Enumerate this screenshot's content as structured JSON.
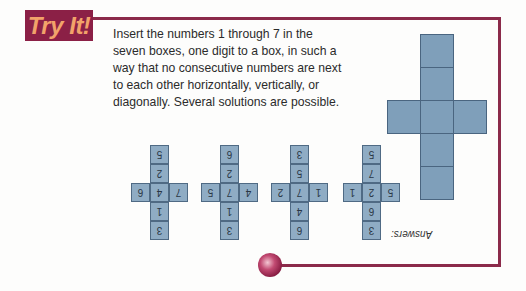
{
  "badge": {
    "label": "Try It!"
  },
  "instructions": {
    "text": "Insert the numbers 1 through 7 in the seven boxes, one digit to a box, in such a way that no consecutive numbers are next to each other horizontally, vertically, or diagonally. Several solutions are possible."
  },
  "answers": {
    "label": "Answers:",
    "orientation": "upside-down",
    "grids": [
      {
        "top": "3",
        "upper": "6",
        "left": "5",
        "center": "2",
        "right": "1",
        "lower": "7",
        "bottom": "5"
      },
      {
        "top": "6",
        "upper": "4",
        "left": "1",
        "center": "7",
        "right": "2",
        "lower": "5",
        "bottom": "3"
      },
      {
        "top": "3",
        "upper": "1",
        "left": "4",
        "center": "7",
        "right": "5",
        "lower": "2",
        "bottom": "6"
      },
      {
        "top": "3",
        "upper": "1",
        "left": "7",
        "center": "4",
        "right": "6",
        "lower": "2",
        "bottom": "5"
      }
    ]
  },
  "colors": {
    "frame": "#8b2a4a",
    "badge_bg": "#8b2046",
    "badge_text": "#f2a36a",
    "cell_fill": "#7f9fba",
    "cell_border": "#4a6580"
  }
}
